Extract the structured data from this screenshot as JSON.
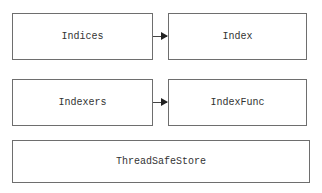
{
  "diagram": {
    "nodes": [
      {
        "id": "indices",
        "label": "Indices"
      },
      {
        "id": "index",
        "label": "Index"
      },
      {
        "id": "indexers",
        "label": "Indexers"
      },
      {
        "id": "indexfunc",
        "label": "IndexFunc"
      },
      {
        "id": "threadsafestore",
        "label": "ThreadSafeStore"
      }
    ],
    "edges": [
      {
        "from": "indices",
        "to": "index"
      },
      {
        "from": "indexers",
        "to": "indexfunc"
      }
    ]
  }
}
